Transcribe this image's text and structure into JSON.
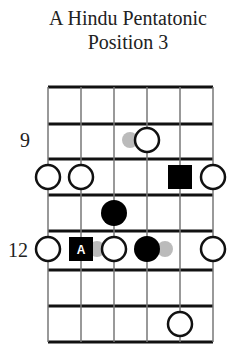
{
  "title": {
    "line1": "A Hindu Pentatonic",
    "line2": "Position 3"
  },
  "diagram": {
    "strings": 6,
    "frets_shown": 7,
    "start_fret": 8,
    "fret_labels": [
      {
        "fret": 9,
        "text": "9"
      },
      {
        "fret": 12,
        "text": "12"
      }
    ],
    "colors": {
      "line": "#111111",
      "open_fill": "#ffffff",
      "filled": "#000000",
      "ghost": "#bbbbbb"
    },
    "notes": [
      {
        "string": 4,
        "fret": 9,
        "type": "open"
      },
      {
        "string": 3,
        "fret": 9,
        "type": "ghost"
      },
      {
        "string": 1,
        "fret": 10,
        "type": "open"
      },
      {
        "string": 2,
        "fret": 10,
        "type": "open"
      },
      {
        "string": 5,
        "fret": 10,
        "type": "square"
      },
      {
        "string": 6,
        "fret": 10,
        "type": "open"
      },
      {
        "string": 3,
        "fret": 11,
        "type": "filled"
      },
      {
        "string": 1,
        "fret": 12,
        "type": "open"
      },
      {
        "string": 2,
        "fret": 12,
        "type": "root",
        "label": "A"
      },
      {
        "string": 3,
        "fret": 12,
        "type": "open"
      },
      {
        "string": 4,
        "fret": 12,
        "type": "filled"
      },
      {
        "string": 6,
        "fret": 12,
        "type": "open"
      },
      {
        "string": 5,
        "fret": 14,
        "type": "open"
      }
    ]
  }
}
